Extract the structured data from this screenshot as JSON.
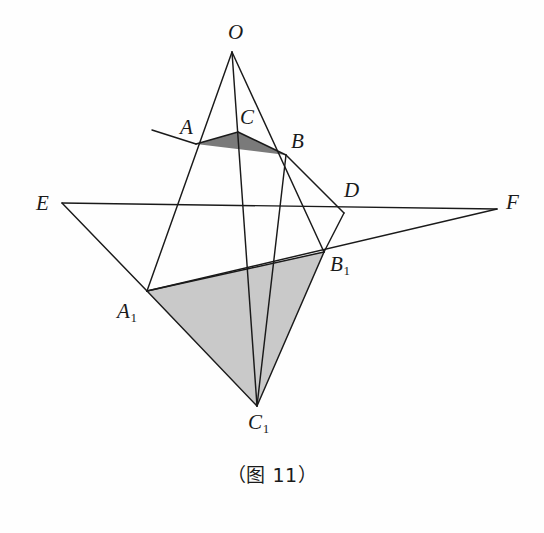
{
  "figure": {
    "caption": "（图 11）",
    "background_color": "#fefefe",
    "line_color": "#1a1a1a",
    "small_triangle_fill": "#7a7a7a",
    "large_triangle_fill": "#c9c9c9"
  },
  "points": {
    "O": {
      "label": "O",
      "sub": "",
      "x": 232,
      "y": 52,
      "label_x": 228,
      "label_y": 22
    },
    "A": {
      "label": "A",
      "sub": "",
      "x": 196,
      "y": 144,
      "label_x": 180,
      "label_y": 117
    },
    "B": {
      "label": "B",
      "sub": "",
      "x": 286,
      "y": 155,
      "label_x": 291,
      "label_y": 131
    },
    "C": {
      "label": "C",
      "sub": "",
      "x": 238,
      "y": 132,
      "label_x": 240,
      "label_y": 107
    },
    "A1": {
      "label": "A",
      "sub": "1",
      "x": 147,
      "y": 291,
      "label_x": 117,
      "label_y": 301
    },
    "B1": {
      "label": "B",
      "sub": "1",
      "x": 324,
      "y": 252,
      "label_x": 330,
      "label_y": 254
    },
    "C1": {
      "label": "C",
      "sub": "1",
      "x": 257,
      "y": 406,
      "label_x": 248,
      "label_y": 412
    },
    "D": {
      "label": "D",
      "sub": "",
      "x": 344,
      "y": 213,
      "label_x": 344,
      "label_y": 180
    },
    "E": {
      "label": "E",
      "sub": "",
      "x": 62,
      "y": 203,
      "label_x": 36,
      "label_y": 193
    },
    "F": {
      "label": "F",
      "sub": "",
      "x": 497,
      "y": 209,
      "label_x": 506,
      "label_y": 192
    }
  },
  "segments": [
    {
      "name": "line-O-to-A1",
      "from": "O",
      "to": "A1"
    },
    {
      "name": "line-O-to-C1",
      "from": "O",
      "to": "C1"
    },
    {
      "name": "line-O-to-B1",
      "from": "O",
      "to": "B1"
    },
    {
      "name": "line-A-to-C",
      "from": "A",
      "to": "C"
    },
    {
      "name": "line-C-to-B",
      "from": "C",
      "to": "B"
    },
    {
      "name": "line-E-to-F",
      "from": "E",
      "to": "F"
    },
    {
      "name": "line-E-to-A1",
      "from": "E",
      "to": "A1"
    },
    {
      "name": "line-A1-to-F",
      "from": "A1",
      "to": "F"
    },
    {
      "name": "line-A1-to-C1",
      "from": "A1",
      "to": "C1"
    },
    {
      "name": "line-B1-to-C1",
      "from": "B1",
      "to": "C1"
    },
    {
      "name": "line-A1-to-B1",
      "from": "A1",
      "to": "B1"
    },
    {
      "name": "line-B-to-C1",
      "from": "B",
      "to": "C1"
    },
    {
      "name": "line-B-to-D",
      "from": "B",
      "to": "D"
    },
    {
      "name": "line-D-to-B1",
      "from": "D",
      "to": "B1"
    }
  ],
  "extensions": [
    {
      "name": "ray-A-upper-left",
      "x1": 196,
      "y1": 144,
      "x2": 152,
      "y2": 130
    }
  ],
  "shaded_regions": [
    {
      "name": "triangle-ABC",
      "vertices": [
        "A",
        "C",
        "B"
      ],
      "fill": "#7a7a7a"
    },
    {
      "name": "triangle-A1B1C1",
      "vertices": [
        "A1",
        "B1",
        "C1"
      ],
      "fill": "#c9c9c9"
    }
  ]
}
